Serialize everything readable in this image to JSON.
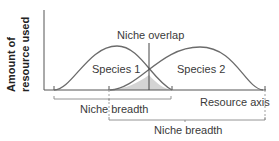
{
  "diagram": {
    "y_axis_label": [
      "Amount of",
      "resource used"
    ],
    "x_axis_label": "Resource axis",
    "species": [
      {
        "name": "Species 1",
        "niche_breadth_label": "Niche breadth"
      },
      {
        "name": "Species 2",
        "niche_breadth_label": "Niche breadth"
      }
    ],
    "overlap_label": "Niche overlap",
    "colors": {
      "curve": "#6b6b6b",
      "overlap_fill": "#d4d4d4",
      "axis": "#555555",
      "text": "#3a3a3a"
    }
  }
}
